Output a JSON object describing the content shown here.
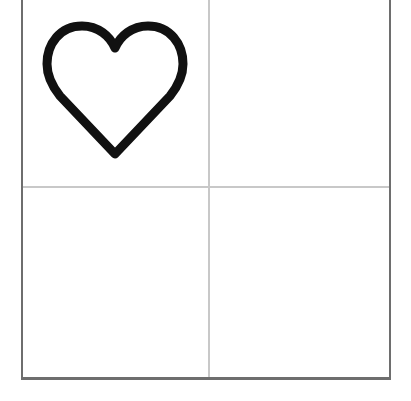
{
  "board": {
    "rows": 2,
    "columns": 2,
    "cells": [
      {
        "row": 0,
        "col": 0,
        "content": "heart-outline"
      },
      {
        "row": 0,
        "col": 1,
        "content": ""
      },
      {
        "row": 1,
        "col": 0,
        "content": ""
      },
      {
        "row": 1,
        "col": 1,
        "content": ""
      }
    ]
  },
  "colors": {
    "border": "#6e6e6e",
    "divider": "#c8c8c8",
    "icon_stroke": "#111111",
    "background": "#ffffff"
  },
  "icons": {
    "cell_0_0": "heart-outline-icon"
  }
}
